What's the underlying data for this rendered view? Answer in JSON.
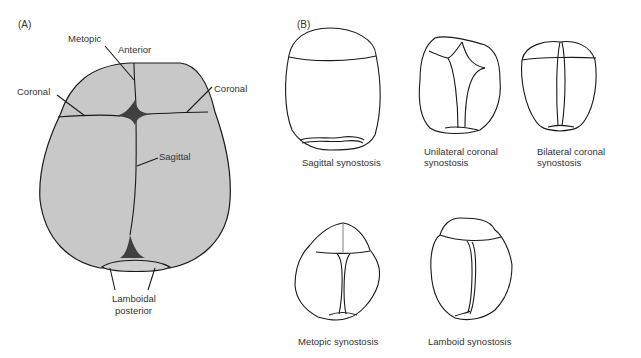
{
  "panel_a": {
    "label": "(A)",
    "labels": {
      "metopic": "Metopic",
      "anterior": "Anterior",
      "coronal_left": "Coronal",
      "coronal_right": "Coronal",
      "sagittal": "Sagittal",
      "lamboidal_line1": "Lamboidal",
      "lamboidal_line2": "posterior"
    }
  },
  "panel_b": {
    "label": "(B)",
    "captions": {
      "sagittal": "Sagittal synostosis",
      "unilateral_line1": "Unilateral coronal",
      "unilateral_line2": "synostosis",
      "bilateral_line1": "Bilateral coronal",
      "bilateral_line2": "synostosis",
      "metopic": "Metopic synostosis",
      "lamboid": "Lamboid synostosis"
    }
  },
  "colors": {
    "skull_fill": "#c8c8c8",
    "fontanelle": "#404040",
    "outline": "#1a1a1a"
  }
}
